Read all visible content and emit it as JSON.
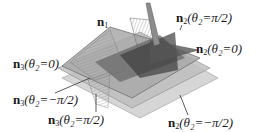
{
  "diagram": {
    "title": "",
    "colors": {
      "plane_light": "#c9c9c9",
      "plane_mid": "#a8a8a8",
      "plane_dark": "#6e6e6e",
      "plane_darkest": "#3f3f3f",
      "hatch": "#8a8a8a",
      "edge": "#555555",
      "text": "#1a1a1a"
    },
    "labels": [
      {
        "id": "n1",
        "vec": "n",
        "sub": "1",
        "rest": "",
        "x": 97,
        "y": 15
      },
      {
        "id": "n2-pi-half",
        "vec": "n",
        "sub": "2",
        "rest": "(θ₂=π/2)",
        "x": 176,
        "y": 11
      },
      {
        "id": "n3-zero",
        "vec": "n",
        "sub": "3",
        "rest": "(θ₂=0)",
        "x": 13,
        "y": 57
      },
      {
        "id": "n2-zero",
        "vec": "n",
        "sub": "2",
        "rest": "(θ₂=0)",
        "x": 196,
        "y": 42
      },
      {
        "id": "n3-neg-pi-half",
        "vec": "n",
        "sub": "3",
        "rest": "(θ₂=−π/2)",
        "x": 13,
        "y": 93
      },
      {
        "id": "n3-pi-half",
        "vec": "n",
        "sub": "3",
        "rest": "(θ₂=π/2)",
        "x": 48,
        "y": 113
      },
      {
        "id": "n2-neg-pi-half",
        "vec": "n",
        "sub": "2",
        "rest": "(θ₂=−π/2)",
        "x": 168,
        "y": 116
      }
    ]
  }
}
